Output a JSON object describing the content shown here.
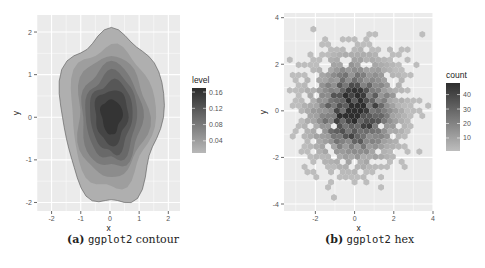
{
  "chart_data": [
    {
      "type": "contour",
      "title": "",
      "caption_label": "(a)",
      "caption_code": "ggplot2",
      "caption_text": "contour",
      "xlabel": "x",
      "ylabel": "y",
      "xlim": [
        -2.5,
        2.4
      ],
      "ylim": [
        -2.2,
        2.4
      ],
      "x_ticks": [
        "-2",
        "-1",
        "0",
        "1",
        "2"
      ],
      "y_ticks": [
        "2",
        "1",
        "0",
        "-1",
        "-2"
      ],
      "grid": true,
      "legend": {
        "title": "level",
        "position": "right",
        "labels": [
          "0.16",
          "0.12",
          "0.08",
          "0.04"
        ],
        "range": [
          0.01,
          0.17
        ],
        "color_low": "#b8b8b8",
        "color_high": "#2b2b2b"
      },
      "contour_levels": [
        0.02,
        0.04,
        0.06,
        0.08,
        0.1,
        0.12,
        0.14,
        0.16
      ],
      "peak": {
        "x": 0.0,
        "y": 0.0,
        "level": 0.16
      }
    },
    {
      "type": "heatmap",
      "subtype": "hexbin",
      "caption_label": "(b)",
      "caption_code": "ggplot2",
      "caption_text": "hex",
      "xlabel": "x",
      "ylabel": "y",
      "xlim": [
        -3.6,
        4.0
      ],
      "ylim": [
        -4.3,
        4.2
      ],
      "x_ticks": [
        "-2",
        "0",
        "2",
        "4"
      ],
      "y_ticks": [
        "4",
        "2",
        "0",
        "-2",
        "-4"
      ],
      "grid": true,
      "legend": {
        "title": "count",
        "position": "right",
        "labels": [
          "40",
          "30",
          "20",
          "10"
        ],
        "range": [
          1,
          48
        ],
        "color_low": "#bdbdbd",
        "color_high": "#2e2e2e"
      },
      "peak": {
        "x": 0.0,
        "y": 0.0,
        "count": 45
      }
    }
  ]
}
